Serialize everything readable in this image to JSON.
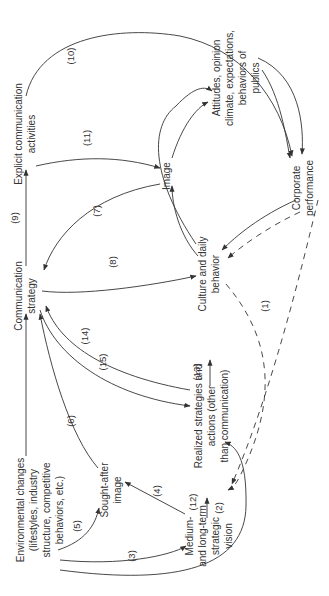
{
  "diagram": {
    "orientation": "rotated 90 degrees counter-clockwise",
    "nodes": {
      "environmental_changes": [
        "Environmental changes",
        "(lifestyles, industry",
        "structure, competitive",
        "behaviors, etc.)"
      ],
      "communication_strategy": [
        "Communication",
        "strategy"
      ],
      "explicit_communication": [
        "Explicit communication",
        "activities"
      ],
      "sought_after_image": [
        "Sought-after",
        "image"
      ],
      "strategic_vision": [
        "Medium-",
        "and long-term",
        "strategic",
        "vision"
      ],
      "realized_strategies": [
        "Realized strategies and",
        "actions (other",
        "than communication)"
      ],
      "culture_behavior": [
        "Culture and daily",
        "behavior"
      ],
      "image": [
        "Image"
      ],
      "attitudes": [
        "Attitudes, opinion",
        "climate, expectations,",
        "behaviors of",
        "publics"
      ],
      "corporate_performance": [
        "Corporate",
        "performance"
      ]
    },
    "edge_labels": {
      "e1": "(1)",
      "e2": "(2)",
      "e3": "(3)",
      "e4": "(4)",
      "e5": "(5)",
      "e6": "(6)",
      "e7": "(7)",
      "e8": "(8)",
      "e9": "(9)",
      "e10": "(10)",
      "e11": "(11)",
      "e12": "(12)",
      "e13": "(13)",
      "e14": "(14)",
      "e15": "(15)"
    },
    "colors": {
      "line": "#333333",
      "text": "#333333",
      "background": "#ffffff"
    }
  }
}
